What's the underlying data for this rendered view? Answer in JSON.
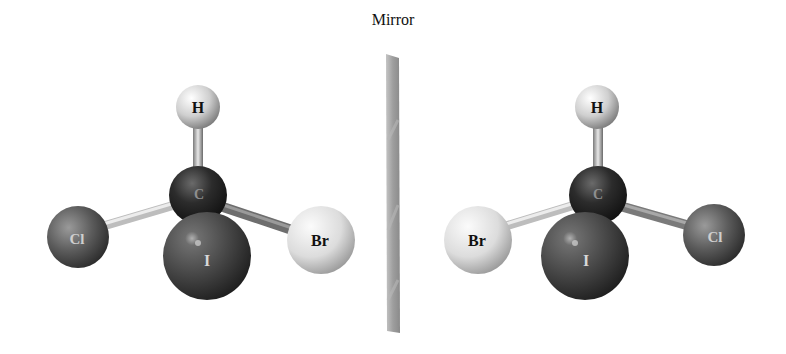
{
  "figure": {
    "mirror_label": "Mirror",
    "molecules": [
      {
        "name": "left-enantiomer",
        "atoms": [
          {
            "symbol": "H",
            "label": "H",
            "cx": 198,
            "cy": 107,
            "r": 22,
            "color": "#d8d8d8",
            "text_color": "#111111"
          },
          {
            "symbol": "C",
            "label": "C",
            "cx": 198,
            "cy": 195,
            "r": 29,
            "color": "#2a2a2a",
            "text_color": "#9a9a9a"
          },
          {
            "symbol": "Cl",
            "label": "Cl",
            "cx": 78,
            "cy": 237,
            "r": 31,
            "color": "#5a5a5a",
            "text_color": "#cfcfcf"
          },
          {
            "symbol": "Br",
            "label": "Br",
            "cx": 321,
            "cy": 240,
            "r": 34,
            "color": "#e2e2e2",
            "text_color": "#111111"
          },
          {
            "symbol": "I",
            "label": "I",
            "cx": 207,
            "cy": 256,
            "r": 44,
            "color": "#4a4a4a",
            "text_color": "#d8d8d8"
          }
        ]
      },
      {
        "name": "right-enantiomer",
        "atoms": [
          {
            "symbol": "H",
            "label": "H",
            "cx": 597,
            "cy": 107,
            "r": 22,
            "color": "#d8d8d8",
            "text_color": "#111111"
          },
          {
            "symbol": "C",
            "label": "C",
            "cx": 598,
            "cy": 195,
            "r": 29,
            "color": "#2a2a2a",
            "text_color": "#9a9a9a"
          },
          {
            "symbol": "Br",
            "label": "Br",
            "cx": 478,
            "cy": 240,
            "r": 34,
            "color": "#e2e2e2",
            "text_color": "#111111"
          },
          {
            "symbol": "Cl",
            "label": "Cl",
            "cx": 714,
            "cy": 235,
            "r": 31,
            "color": "#5a5a5a",
            "text_color": "#cfcfcf"
          },
          {
            "symbol": "I",
            "label": "I",
            "cx": 585,
            "cy": 256,
            "r": 44,
            "color": "#4a4a4a",
            "text_color": "#d8d8d8"
          }
        ]
      }
    ]
  }
}
